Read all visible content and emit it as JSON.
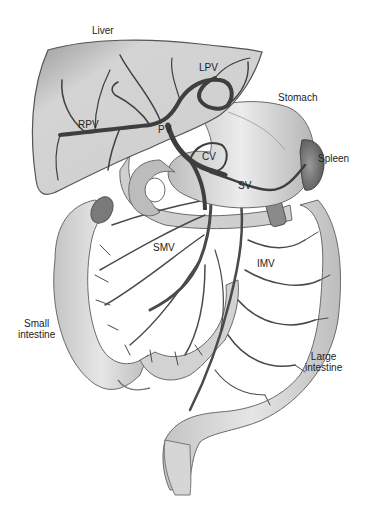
{
  "diagram": {
    "colors": {
      "background": "#ffffff",
      "organ_fill": "#d9d9d9",
      "liver_fill": "#c8c8c8",
      "vein_stroke": "#4a4a4a",
      "outline": "#555555",
      "label_text": "#222222"
    },
    "labels": {
      "liver": "Liver",
      "lpv": "LPV",
      "rpv": "RPV",
      "pv": "PV",
      "stomach": "Stomach",
      "cv": "CV",
      "spleen": "Spleen",
      "sv": "SV",
      "smv": "SMV",
      "imv": "IMV",
      "small_intestine_line1": "Small",
      "small_intestine_line2": "intestine",
      "large_intestine_line1": "Large",
      "large_intestine_line2": "intestine"
    }
  }
}
